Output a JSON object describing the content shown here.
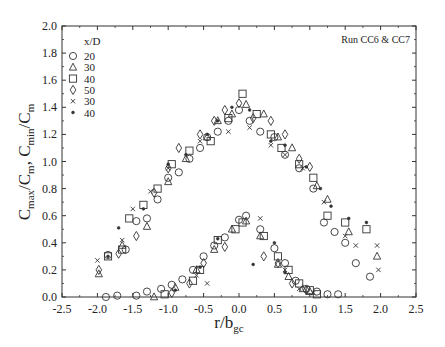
{
  "chart_data": {
    "type": "scatter",
    "title": "",
    "annotation": "Run CC6 & CC7",
    "xlabel_main": "r/b",
    "xlabel_sub": "gc",
    "ylabel": "C_max/C_m, C_min/C_m",
    "ylabel_parts": {
      "a": "C",
      "a_sub": "max",
      "b": "/C",
      "b_sub": "m",
      "c": ", C",
      "c_sub": "min",
      "d": "/C",
      "d_sub": "m"
    },
    "xlim": [
      -2.5,
      2.5
    ],
    "ylim": [
      0.0,
      2.0
    ],
    "xticks": [
      "-2.5",
      "-2.0",
      "-1.5",
      "-1.0",
      "-0.5",
      "0.0",
      "0.5",
      "1.0",
      "1.5",
      "2.0",
      "2.5"
    ],
    "yticks": [
      "0.0",
      "0.2",
      "0.4",
      "0.6",
      "0.8",
      "1.0",
      "1.2",
      "1.4",
      "1.6",
      "1.8",
      "2.0"
    ],
    "grid": false,
    "legend": {
      "title": "x/D",
      "position": "top-left"
    },
    "series": [
      {
        "name": "20",
        "marker": "circle",
        "points": [
          [
            -1.85,
            0.31
          ],
          [
            -1.6,
            0.35
          ],
          [
            -1.45,
            0.56
          ],
          [
            -1.3,
            0.58
          ],
          [
            -1.15,
            0.72
          ],
          [
            -1.0,
            0.88
          ],
          [
            -0.85,
            0.92
          ],
          [
            -0.7,
            1.02
          ],
          [
            -0.55,
            1.1
          ],
          [
            -0.45,
            1.18
          ],
          [
            -0.3,
            1.22
          ],
          [
            -0.15,
            1.3
          ],
          [
            0.0,
            1.38
          ],
          [
            0.15,
            1.3
          ],
          [
            0.3,
            1.22
          ],
          [
            0.5,
            1.18
          ],
          [
            0.65,
            1.05
          ],
          [
            0.85,
            0.95
          ],
          [
            1.05,
            0.8
          ],
          [
            1.2,
            0.55
          ],
          [
            1.35,
            0.48
          ],
          [
            1.5,
            0.4
          ],
          [
            1.65,
            0.25
          ],
          [
            1.85,
            0.15
          ],
          [
            -1.88,
            0.0
          ],
          [
            -1.72,
            0.01
          ],
          [
            -1.45,
            0.01
          ],
          [
            -1.3,
            0.04
          ],
          [
            -1.1,
            0.06
          ],
          [
            -0.95,
            0.09
          ],
          [
            -0.8,
            0.13
          ],
          [
            -0.65,
            0.2
          ],
          [
            -0.5,
            0.3
          ],
          [
            -0.35,
            0.38
          ],
          [
            -0.2,
            0.44
          ],
          [
            0.0,
            0.57
          ],
          [
            0.1,
            0.6
          ],
          [
            0.3,
            0.5
          ],
          [
            0.5,
            0.36
          ],
          [
            0.65,
            0.25
          ],
          [
            0.8,
            0.12
          ],
          [
            0.95,
            0.06
          ],
          [
            1.1,
            0.04
          ],
          [
            1.25,
            0.02
          ],
          [
            1.4,
            0.02
          ]
        ]
      },
      {
        "name": "30",
        "marker": "triangle",
        "points": [
          [
            -1.98,
            0.17
          ],
          [
            -1.65,
            0.38
          ],
          [
            -1.3,
            0.52
          ],
          [
            -1.0,
            0.85
          ],
          [
            -0.75,
            1.02
          ],
          [
            -0.45,
            1.18
          ],
          [
            -0.3,
            1.3
          ],
          [
            -0.1,
            1.35
          ],
          [
            0.1,
            1.42
          ],
          [
            0.35,
            1.35
          ],
          [
            0.55,
            1.18
          ],
          [
            0.75,
            1.1
          ],
          [
            1.1,
            0.82
          ],
          [
            1.25,
            0.72
          ],
          [
            1.55,
            0.48
          ],
          [
            1.95,
            0.3
          ],
          [
            -1.2,
            0.0
          ],
          [
            -0.9,
            0.07
          ],
          [
            -0.6,
            0.2
          ],
          [
            -0.35,
            0.35
          ],
          [
            -0.1,
            0.5
          ],
          [
            0.1,
            0.56
          ],
          [
            0.3,
            0.45
          ],
          [
            0.55,
            0.24
          ],
          [
            0.7,
            0.15
          ],
          [
            0.9,
            0.06
          ],
          [
            1.0,
            0.04
          ]
        ]
      },
      {
        "name": "40",
        "marker": "square",
        "points": [
          [
            -1.85,
            0.3
          ],
          [
            -1.65,
            0.35
          ],
          [
            -1.55,
            0.58
          ],
          [
            -1.35,
            0.68
          ],
          [
            -1.15,
            0.8
          ],
          [
            -0.95,
            0.98
          ],
          [
            -0.7,
            1.08
          ],
          [
            -0.4,
            1.15
          ],
          [
            -0.15,
            1.32
          ],
          [
            0.05,
            1.5
          ],
          [
            0.25,
            1.35
          ],
          [
            0.45,
            1.2
          ],
          [
            0.6,
            1.1
          ],
          [
            0.85,
            0.98
          ],
          [
            1.05,
            0.88
          ],
          [
            1.25,
            0.6
          ],
          [
            1.5,
            0.55
          ],
          [
            1.8,
            0.5
          ],
          [
            -1.05,
            0.02
          ],
          [
            -0.65,
            0.12
          ],
          [
            -0.55,
            0.2
          ],
          [
            -0.3,
            0.42
          ],
          [
            -0.05,
            0.5
          ],
          [
            0.05,
            0.55
          ],
          [
            0.35,
            0.45
          ],
          [
            0.55,
            0.3
          ],
          [
            0.7,
            0.2
          ],
          [
            0.85,
            0.1
          ],
          [
            1.0,
            0.05
          ],
          [
            1.1,
            0.02
          ]
        ]
      },
      {
        "name": "50",
        "marker": "diamond",
        "points": [
          [
            -1.98,
            0.2
          ],
          [
            -1.7,
            0.32
          ],
          [
            -1.45,
            0.45
          ],
          [
            -1.2,
            0.77
          ],
          [
            -1.0,
            0.95
          ],
          [
            -0.85,
            1.1
          ],
          [
            -0.55,
            1.2
          ],
          [
            -0.35,
            1.3
          ],
          [
            -0.2,
            1.38
          ],
          [
            0.0,
            1.43
          ],
          [
            0.2,
            1.32
          ],
          [
            0.45,
            1.3
          ],
          [
            0.65,
            1.2
          ],
          [
            0.85,
            1.02
          ],
          [
            1.0,
            0.96
          ],
          [
            -0.95,
            0.03
          ],
          [
            -0.7,
            0.1
          ],
          [
            -0.5,
            0.25
          ],
          [
            -0.2,
            0.37
          ],
          [
            0.35,
            0.3
          ],
          [
            0.55,
            0.25
          ],
          [
            0.75,
            0.1
          ],
          [
            0.95,
            0.05
          ]
        ]
      },
      {
        "name": "30 (×)",
        "marker": "cross",
        "points": [
          [
            -2.0,
            0.27
          ],
          [
            -1.65,
            0.42
          ],
          [
            -1.5,
            0.65
          ],
          [
            -1.25,
            0.78
          ],
          [
            -1.0,
            0.95
          ],
          [
            -0.55,
            1.15
          ],
          [
            -0.15,
            1.22
          ],
          [
            0.15,
            1.25
          ],
          [
            0.45,
            1.12
          ],
          [
            0.65,
            1.05
          ],
          [
            0.9,
            0.95
          ],
          [
            1.2,
            0.7
          ],
          [
            1.5,
            0.45
          ],
          [
            1.65,
            0.38
          ],
          [
            1.95,
            0.38
          ],
          [
            1.97,
            0.2
          ],
          [
            -0.6,
            0.16
          ],
          [
            -0.45,
            0.1
          ],
          [
            0.3,
            0.58
          ],
          [
            0.65,
            0.2
          ],
          [
            0.85,
            0.06
          ],
          [
            1.05,
            0.03
          ]
        ]
      },
      {
        "name": "40 (*)",
        "marker": "star",
        "points": [
          [
            -1.85,
            0.3
          ],
          [
            -1.7,
            0.51
          ],
          [
            -1.35,
            0.65
          ],
          [
            -1.0,
            0.98
          ],
          [
            -0.75,
            1.05
          ],
          [
            -0.45,
            1.2
          ],
          [
            -0.3,
            1.3
          ],
          [
            -0.1,
            1.4
          ],
          [
            0.15,
            1.38
          ],
          [
            0.45,
            1.15
          ],
          [
            0.65,
            1.12
          ],
          [
            0.95,
            0.96
          ],
          [
            1.15,
            0.8
          ],
          [
            1.3,
            0.67
          ],
          [
            1.55,
            0.58
          ],
          [
            1.8,
            0.55
          ],
          [
            -0.9,
            0.05
          ],
          [
            -0.55,
            0.22
          ],
          [
            -0.3,
            0.43
          ],
          [
            0.2,
            0.24
          ],
          [
            0.5,
            0.4
          ],
          [
            0.65,
            0.18
          ]
        ]
      }
    ]
  }
}
